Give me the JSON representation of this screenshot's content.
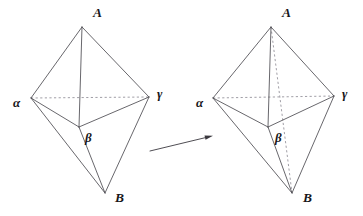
{
  "figure": {
    "background_color": "#ffffff",
    "edge_color": "#4d4b52",
    "hidden_edge_color": "#8f8c96",
    "label_color": "#17161a",
    "width": 363,
    "height": 216
  },
  "left_figure": {
    "name": "left-bipyramid",
    "caption": "",
    "vertices": {
      "A": {
        "label": "A",
        "x": 82,
        "y": 27,
        "label_x": 93,
        "label_y": 17
      },
      "alpha": {
        "label": "α",
        "x": 31,
        "y": 98,
        "label_x": 13,
        "label_y": 107
      },
      "gamma": {
        "label": "γ",
        "x": 149,
        "y": 97,
        "label_x": 157,
        "label_y": 98
      },
      "beta": {
        "label": "β",
        "x": 79,
        "y": 127,
        "label_x": 85,
        "label_y": 142
      },
      "B": {
        "label": "B",
        "x": 105,
        "y": 193,
        "label_x": 115,
        "label_y": 202
      }
    },
    "solid_edges": [
      [
        "A",
        "alpha"
      ],
      [
        "A",
        "gamma"
      ],
      [
        "A",
        "beta"
      ],
      [
        "alpha",
        "beta"
      ],
      [
        "gamma",
        "beta"
      ],
      [
        "alpha",
        "B"
      ],
      [
        "gamma",
        "B"
      ],
      [
        "beta",
        "B"
      ]
    ],
    "hidden_edges": [
      [
        "alpha",
        "gamma"
      ]
    ]
  },
  "right_figure": {
    "name": "right-bipyramid",
    "caption": "",
    "vertices": {
      "A": {
        "label": "A",
        "x": 271,
        "y": 27,
        "label_x": 282,
        "label_y": 17
      },
      "alpha": {
        "label": "α",
        "x": 213,
        "y": 98,
        "label_x": 196,
        "label_y": 107
      },
      "gamma": {
        "label": "γ",
        "x": 334,
        "y": 96,
        "label_x": 342,
        "label_y": 98
      },
      "beta": {
        "label": "β",
        "x": 268,
        "y": 127,
        "label_x": 275,
        "label_y": 142
      },
      "B": {
        "label": "B",
        "x": 292,
        "y": 193,
        "label_x": 303,
        "label_y": 202
      }
    },
    "solid_edges": [
      [
        "A",
        "alpha"
      ],
      [
        "A",
        "gamma"
      ],
      [
        "A",
        "beta"
      ],
      [
        "alpha",
        "beta"
      ],
      [
        "gamma",
        "beta"
      ],
      [
        "alpha",
        "B"
      ],
      [
        "gamma",
        "B"
      ],
      [
        "beta",
        "B"
      ]
    ],
    "hidden_edges": [
      [
        "alpha",
        "gamma"
      ],
      [
        "A",
        "B"
      ]
    ]
  },
  "arrow": {
    "name": "transformation-arrow",
    "x1": 150,
    "y1": 151,
    "x2": 212,
    "y2": 136,
    "color": "#3b393f"
  }
}
